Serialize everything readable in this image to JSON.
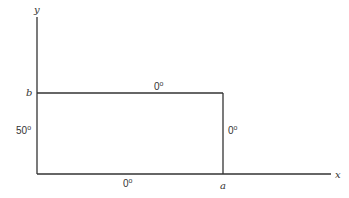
{
  "diagram": {
    "axes": {
      "x_label": "x",
      "y_label": "y"
    },
    "points": {
      "a": "a",
      "b": "b"
    },
    "boundary_values": {
      "top": "0",
      "left": "50",
      "right": "0",
      "bottom": "0",
      "unit": "o"
    }
  }
}
